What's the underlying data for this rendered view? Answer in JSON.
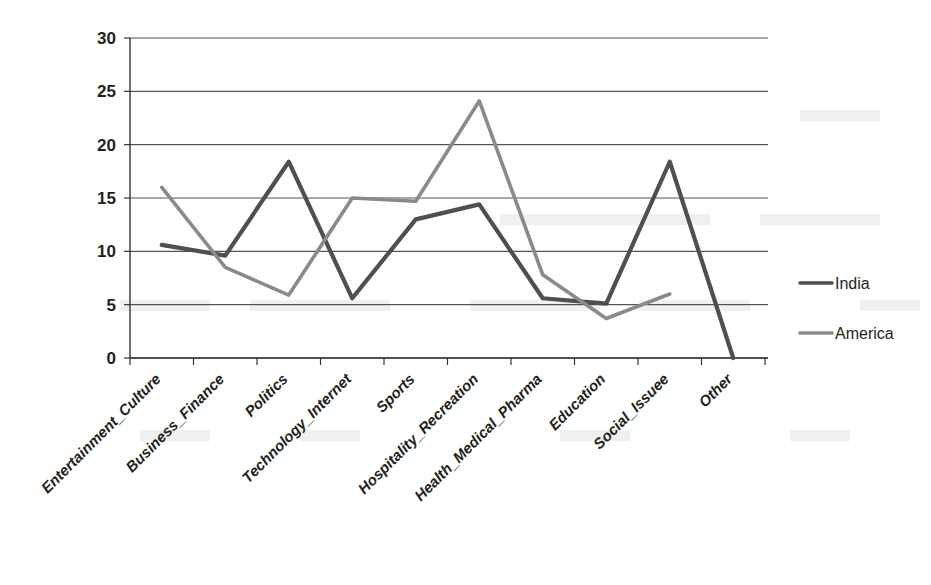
{
  "chart_data": {
    "type": "line",
    "title": "",
    "xlabel": "",
    "ylabel": "",
    "ylim": [
      0,
      30
    ],
    "yticks": [
      0,
      5,
      10,
      15,
      20,
      25,
      30
    ],
    "grid": true,
    "legend_position": "right",
    "categories": [
      "Entertainment_Culture",
      "Business_Finance",
      "Politics",
      "Technology_Internet",
      "Sports",
      "Hospitality_Recreation",
      "Health_Medical_Pharma",
      "Education",
      "Social_Issuee",
      "Other"
    ],
    "series": [
      {
        "name": "India",
        "color": "#4f4f4f",
        "values": [
          10.6,
          9.6,
          18.4,
          5.6,
          13.0,
          14.4,
          5.6,
          5.1,
          18.4,
          0
        ]
      },
      {
        "name": "America",
        "color": "#8a8a8a",
        "values": [
          16.0,
          8.5,
          5.9,
          15.0,
          14.7,
          24.1,
          7.8,
          3.7,
          6.0,
          null
        ]
      }
    ]
  },
  "axis": {
    "y_tick_labels": [
      "30",
      "25",
      "20",
      "15",
      "10",
      "5",
      "0"
    ]
  },
  "legend": {
    "items": [
      {
        "label": "India",
        "color": "#4f4f4f"
      },
      {
        "label": "America",
        "color": "#8a8a8a"
      }
    ]
  }
}
